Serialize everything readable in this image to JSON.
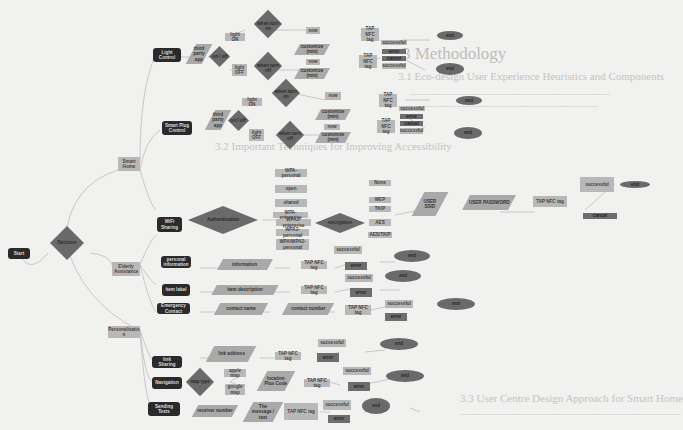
{
  "background_page": {
    "heading": "3 Methodology",
    "sub1": "3.1 Eco-design User Experience Heuristics and Components",
    "sub2": "3.2 Important Techniques for Improving Accessibility",
    "sub3": "3.3 User Centre Design Approach for Smart Home"
  },
  "nodes": {
    "start": "Start",
    "decision": "Decision",
    "smart_home": "Smart Home",
    "elderly_assistance": "Elderly Assistance",
    "personalisation": "Personalisatio n",
    "light_control": "Light Control",
    "smart_plug_control": "Smart Plug Control",
    "wifi_sharing": "WiFi Sharing",
    "personal_information": "personal information",
    "item_label": "item label",
    "emergency_contact": "Emergency Contact",
    "link_sharing": "link Sharing",
    "navigation": "Navigation",
    "sending_texts": "Sending Texts",
    "third_party_app_1": "third party app",
    "on_off_1": "on / off",
    "light_on_1": "light ON",
    "light_off_1": "light OFF",
    "when_turn_on_1": "when turn on",
    "when_turn_off_1": "when turn off",
    "third_party_app_2": "third party app",
    "on_off_2": "on / off",
    "light_on_2": "light ON",
    "light_off_2": "light OFF",
    "when_turn_on_2": "when turn on",
    "when_turn_off_2": "when turn off",
    "now": "now",
    "customize": "customize (min)",
    "tap_nfc_tag": "TAP NFC tag",
    "successful": "successful",
    "error": "error",
    "cancel": "cancel",
    "end": "end",
    "authentication": "Authentication",
    "encryption": "encryption",
    "auth_options": [
      "WPA-personal",
      "open",
      "shared",
      "WPA-enterprise",
      "WPA2-enterprise",
      "WPA2-personal",
      "WPA/WPA2-personal"
    ],
    "enc_options": [
      "None",
      "WEP",
      "TKIP",
      "AES",
      "AES/TKIP"
    ],
    "user_ssid": "USER SSID",
    "user_password": "USER PASSWORD",
    "information": "information",
    "item_description": "item description",
    "contact_name": "contact name",
    "contact_number": "contact number",
    "link_address": "link address",
    "map_type": "map type",
    "apple_map": "apple map",
    "google_map": "google map",
    "location_plus_code": "location Plus Code",
    "receiver_number": "receiver number",
    "the_message": "The message / text"
  },
  "colors": {
    "page": "#f1f1f0",
    "terminal": "#2a2a2a",
    "process": "#b8b8b8",
    "io": "#a9a9a9",
    "decision": "#6a6a6a",
    "end": "#6a6a6a",
    "line": "#bdbdbd"
  }
}
